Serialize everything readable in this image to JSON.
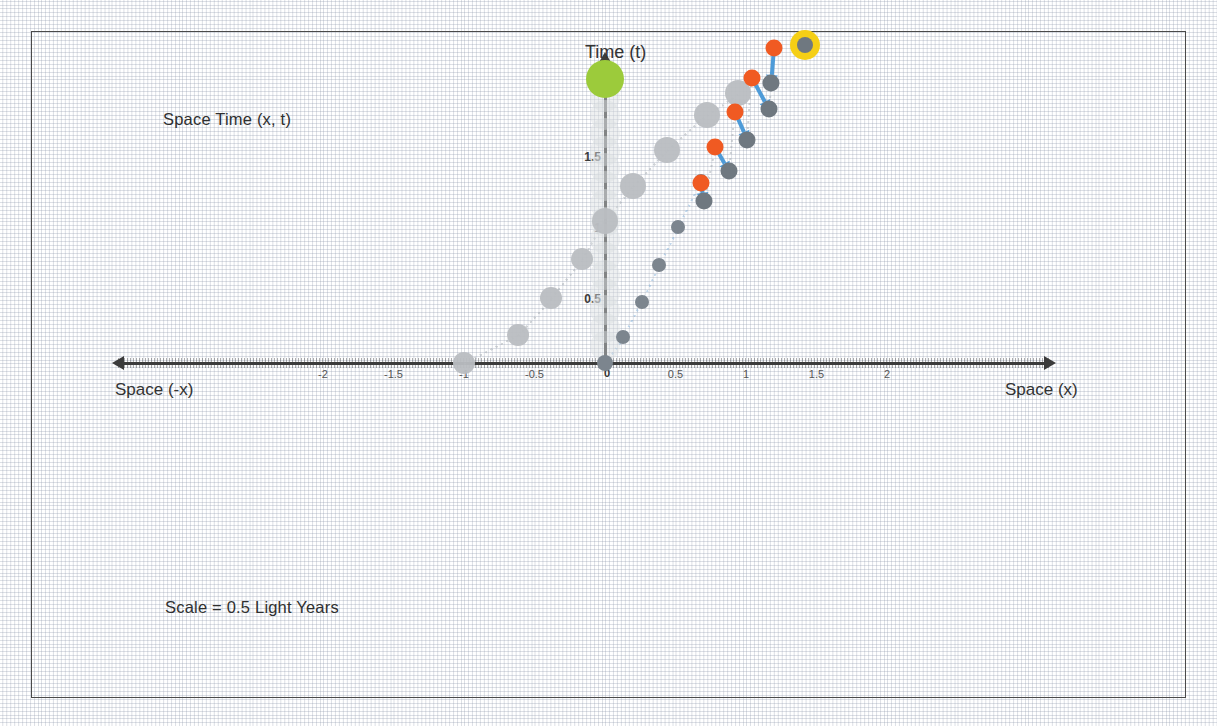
{
  "figure": {
    "caption_top": "Space Time  (x, t)",
    "caption_bottom": "Scale = 0.5 Light Years",
    "axis_title_time": "Time (t)",
    "axis_title_space_pos": "Space (x)",
    "axis_title_space_neg": "Space (-x)",
    "colors": {
      "emitter_green": "#9ccb3b",
      "observer_highlight": "#f5cf16",
      "photon_orange": "#f05a22",
      "particle_gray": "#7c858e",
      "connector_blue": "#4e9bd8",
      "ghost_gray": "#cfd4d8",
      "axis": "#3b3b3b",
      "grid": "#8c96aa"
    }
  },
  "chart_data": {
    "type": "scatter",
    "title": "Space Time  (x, t)",
    "xlabel": "Space (x)",
    "ylabel": "Time (t)",
    "annotations": [
      "Space Time  (x, t)",
      "Scale = 0.5 Light Years",
      "Time (t)",
      "Space (x)",
      "Space (-x)"
    ],
    "grid": true,
    "legend": "none",
    "xlim": [
      -2.45,
      2.55
    ],
    "ylim": [
      -0.15,
      2.2
    ],
    "xticks": [
      -2,
      -1.5,
      -1,
      -0.5,
      0,
      0.5,
      1,
      1.5,
      2
    ],
    "xticklabels": [
      "-2",
      "-1.5",
      "-1",
      "-0.5",
      "0",
      "0.5",
      "1",
      "1.5",
      "2"
    ],
    "yticks": [
      0.5,
      1,
      1.5,
      2
    ],
    "yticklabels": [
      "0.5",
      "1",
      "1.5",
      "2"
    ],
    "scale_note": "Scale = 0.5 Light Years",
    "series": [
      {
        "name": "worldline-particles",
        "marker": "circle",
        "color": "#7c858e",
        "points": [
          {
            "x": 0.0,
            "t": 0.0
          },
          {
            "x": 0.13,
            "t": 0.18
          },
          {
            "x": 0.26,
            "t": 0.43
          },
          {
            "x": 0.38,
            "t": 0.69
          },
          {
            "x": 0.52,
            "t": 0.96
          },
          {
            "x": 0.68,
            "t": 1.28
          }
        ]
      },
      {
        "name": "ghost-trail-left",
        "marker": "circle-large-pale",
        "color": "#b9bdc1",
        "points": [
          {
            "x": -1.0,
            "t": 0.0
          },
          {
            "x": -0.62,
            "t": 0.2
          },
          {
            "x": -0.38,
            "t": 0.46
          },
          {
            "x": -0.16,
            "t": 0.73
          },
          {
            "x": 0.0,
            "t": 1.0
          },
          {
            "x": 0.2,
            "t": 1.25
          },
          {
            "x": 0.44,
            "t": 1.5
          },
          {
            "x": 0.72,
            "t": 1.75
          },
          {
            "x": 0.94,
            "t": 1.9
          }
        ]
      },
      {
        "name": "photon-emissions",
        "marker": "circle",
        "color": "#f05a22",
        "points": [
          {
            "x": 0.68,
            "t": 1.27
          },
          {
            "x": 0.78,
            "t": 1.52
          },
          {
            "x": 0.92,
            "t": 1.77
          },
          {
            "x": 1.04,
            "t": 2.01
          },
          {
            "x": 1.2,
            "t": 2.22
          }
        ]
      },
      {
        "name": "photon-receptions",
        "marker": "circle",
        "color": "#6f7880",
        "points": [
          {
            "x": 0.7,
            "t": 1.14
          },
          {
            "x": 0.88,
            "t": 1.35
          },
          {
            "x": 1.01,
            "t": 1.57
          },
          {
            "x": 1.16,
            "t": 1.79
          },
          {
            "x": 1.18,
            "t": 1.97
          }
        ]
      },
      {
        "name": "emitter-marker",
        "marker": "circle-green",
        "color": "#9ccb3b",
        "points": [
          {
            "x": 0.0,
            "t": 2.0
          }
        ]
      },
      {
        "name": "observer-marker",
        "marker": "circle-halo-yellow",
        "color": "#f5cf16",
        "points": [
          {
            "x": 1.42,
            "t": 2.24
          }
        ]
      }
    ],
    "connectors": [
      {
        "from": {
          "x": 0.68,
          "t": 1.27
        },
        "to": {
          "x": 0.7,
          "t": 1.14
        },
        "color": "#4e9bd8",
        "style": "arrow"
      },
      {
        "from": {
          "x": 0.78,
          "t": 1.52
        },
        "to": {
          "x": 0.88,
          "t": 1.35
        },
        "color": "#4e9bd8",
        "style": "arrow"
      },
      {
        "from": {
          "x": 0.92,
          "t": 1.77
        },
        "to": {
          "x": 1.01,
          "t": 1.57
        },
        "color": "#4e9bd8",
        "style": "arrow"
      },
      {
        "from": {
          "x": 1.04,
          "t": 2.01
        },
        "to": {
          "x": 1.16,
          "t": 1.79
        },
        "color": "#4e9bd8",
        "style": "arrow"
      },
      {
        "from": {
          "x": 1.2,
          "t": 2.22
        },
        "to": {
          "x": 1.18,
          "t": 1.97
        },
        "color": "#4e9bd8",
        "style": "arrow"
      }
    ]
  }
}
